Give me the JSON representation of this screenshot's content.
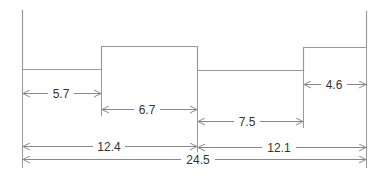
{
  "diagram": {
    "type": "stepped-profile-dimension-drawing",
    "line_color": "#888888",
    "text_color": "#333333",
    "dimensions": {
      "d1": "5.7",
      "d2": "6.7",
      "d3": "7.5",
      "d4": "4.6",
      "d5": "12.4",
      "d6": "12.1",
      "d7": "24.5"
    }
  }
}
